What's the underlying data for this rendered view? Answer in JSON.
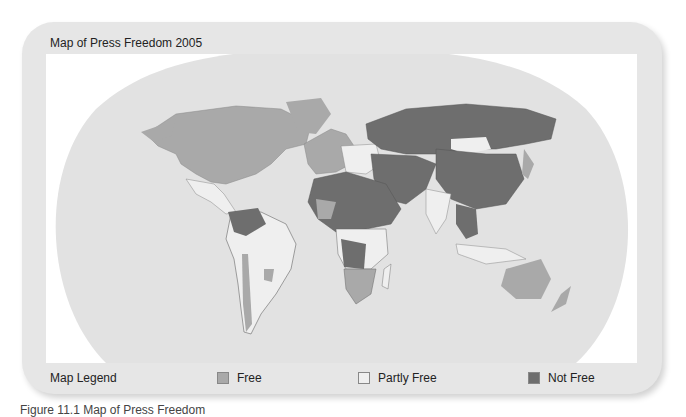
{
  "map": {
    "title": "Map of Press Freedom 2005",
    "colors": {
      "ocean": "#e2e2e2",
      "free": "#a9a9a9",
      "partly_free": "#efefef",
      "not_free": "#6e6e6e",
      "border": "#555555"
    }
  },
  "legend": {
    "title": "Map Legend",
    "items": [
      {
        "label": "Free",
        "color": "#a9a9a9"
      },
      {
        "label": "Partly Free",
        "color": "#efefef"
      },
      {
        "label": "Not Free",
        "color": "#6e6e6e"
      }
    ]
  },
  "caption": {
    "text": "Figure 11.1   Map of Press Freedom"
  }
}
